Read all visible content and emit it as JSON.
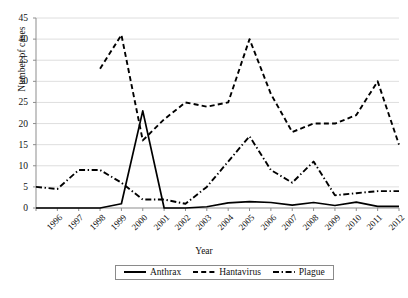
{
  "chart_data": {
    "type": "line",
    "title": "",
    "xlabel": "Year",
    "ylabel": "Number of cases",
    "grid": true,
    "legend_position": "bottom",
    "xlim": [
      1996,
      2013
    ],
    "ylim": [
      0,
      45
    ],
    "ytick_values": [
      0,
      5,
      10,
      15,
      20,
      25,
      30,
      35,
      40,
      45
    ],
    "ytick_labels": [
      "0",
      "5",
      "10",
      "15",
      "20",
      "25",
      "30",
      "35",
      "40",
      "45"
    ],
    "categories": [
      1996,
      1997,
      1998,
      1999,
      2000,
      2001,
      2002,
      2003,
      2004,
      2005,
      2006,
      2007,
      2008,
      2009,
      2010,
      2011,
      2012,
      2013
    ],
    "xtick_labels": [
      "1996",
      "1997",
      "1998",
      "1999",
      "2000",
      "2001",
      "2002",
      "2003",
      "2004",
      "2005",
      "2006",
      "2007",
      "2008",
      "2009",
      "2010",
      "2011",
      "2012",
      "2013"
    ],
    "series": [
      {
        "name": "Anthrax",
        "style": "solid",
        "color": "#000000",
        "values": [
          0,
          0,
          0,
          0,
          1,
          23,
          0,
          0,
          0.3,
          1.2,
          1.5,
          1.3,
          0.7,
          1.3,
          0.6,
          1.4,
          0.4,
          0.4
        ]
      },
      {
        "name": "Hantavirus",
        "style": "dashed",
        "color": "#000000",
        "values": [
          null,
          null,
          null,
          33,
          41,
          16,
          21,
          25,
          24,
          25,
          40,
          27,
          18,
          20,
          20,
          22,
          30,
          15
        ]
      },
      {
        "name": "Plague",
        "style": "dashdot",
        "color": "#000000",
        "values": [
          5,
          4.5,
          9,
          9,
          6,
          2,
          2,
          1,
          5,
          11,
          17,
          9,
          6,
          11,
          3,
          3.5,
          4,
          4
        ]
      }
    ]
  },
  "legend": {
    "items": [
      {
        "label": "Anthrax",
        "style": "solid"
      },
      {
        "label": "Hantavirus",
        "style": "dashed"
      },
      {
        "label": "Plague",
        "style": "dashdot"
      }
    ]
  }
}
